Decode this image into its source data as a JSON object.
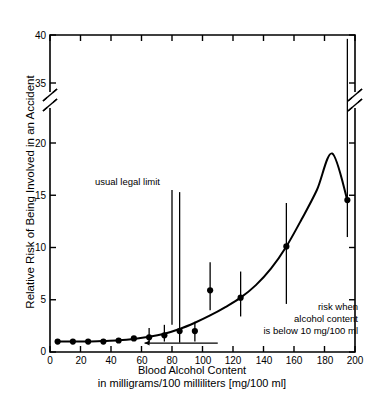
{
  "chart_data": {
    "type": "scatter",
    "title": "",
    "xlabel": "Blood Alcohol Content in milligrams/100 milliliters [mg/100 ml]",
    "ylabel": "Relative Risk of Being Involved in an Accident",
    "xlim": [
      0,
      200
    ],
    "ylim": [
      0,
      40
    ],
    "grid": false,
    "legend_position": "none",
    "y_axis_break": {
      "from": 20,
      "to": 35,
      "label": "axis-break"
    },
    "xticks": [
      0,
      20,
      40,
      60,
      80,
      100,
      120,
      140,
      160,
      180,
      200
    ],
    "yticks": [
      0,
      5,
      10,
      15,
      20,
      35,
      40
    ],
    "x": [
      5,
      15,
      25,
      35,
      45,
      55,
      65,
      75,
      85,
      95,
      105,
      125,
      155,
      195
    ],
    "values": [
      1.0,
      1.0,
      1.0,
      1.0,
      1.1,
      1.3,
      1.4,
      1.6,
      2.0,
      2.0,
      5.9,
      5.2,
      10.1,
      22.8
    ],
    "error_low": [
      1.0,
      1.0,
      1.0,
      1.0,
      1.1,
      1.2,
      0.9,
      1.0,
      0.9,
      1.0,
      4.0,
      3.4,
      4.6,
      11.0
    ],
    "error_high": [
      1.0,
      1.0,
      1.0,
      1.0,
      1.2,
      1.5,
      2.3,
      2.6,
      15.3,
      2.9,
      8.6,
      7.7,
      22.5,
      39.6
    ],
    "fit_curve": [
      [
        5,
        1.0
      ],
      [
        15,
        1.0
      ],
      [
        25,
        1.0
      ],
      [
        35,
        1.05
      ],
      [
        45,
        1.12
      ],
      [
        55,
        1.25
      ],
      [
        65,
        1.45
      ],
      [
        75,
        1.75
      ],
      [
        85,
        2.2
      ],
      [
        95,
        2.8
      ],
      [
        105,
        3.5
      ],
      [
        115,
        4.3
      ],
      [
        125,
        5.2
      ],
      [
        135,
        6.4
      ],
      [
        145,
        8.0
      ],
      [
        155,
        10.1
      ],
      [
        165,
        12.7
      ],
      [
        175,
        15.5
      ],
      [
        185,
        19.0
      ],
      [
        195,
        22.8
      ]
    ],
    "baseline_reference": {
      "y": 0.85,
      "x_start": 62,
      "x_end": 110,
      "arrow": "left"
    },
    "annotations": [
      {
        "name": "usual-legal-limit",
        "text": "usual legal limit",
        "x": 80,
        "y": 15.5
      },
      {
        "name": "baseline-risk-note",
        "line1": "risk when",
        "line2": "alcohol content",
        "line3": "is below 10 mg/100 ml",
        "x": 170,
        "y": 3.5
      }
    ]
  },
  "axes": {
    "y_title": "Relative Risk of Being Involved in an Accident",
    "x_title_line1": "Blood Alcohol Content",
    "x_title_line2": "in milligrams/100 milliliters [mg/100 ml]",
    "ytick_labels": [
      "40",
      "35",
      "20",
      "15",
      "10",
      "5",
      "0"
    ],
    "xtick_labels": [
      "0",
      "20",
      "40",
      "60",
      "80",
      "100",
      "120",
      "140",
      "160",
      "180",
      "200"
    ]
  },
  "annotations": {
    "legal_limit": "usual legal limit",
    "baseline_line1": "risk when",
    "baseline_line2": "alcohol content",
    "baseline_line3": "is below 10 mg/100 ml"
  },
  "colors": {
    "ink": "#000000",
    "background": "#ffffff"
  }
}
